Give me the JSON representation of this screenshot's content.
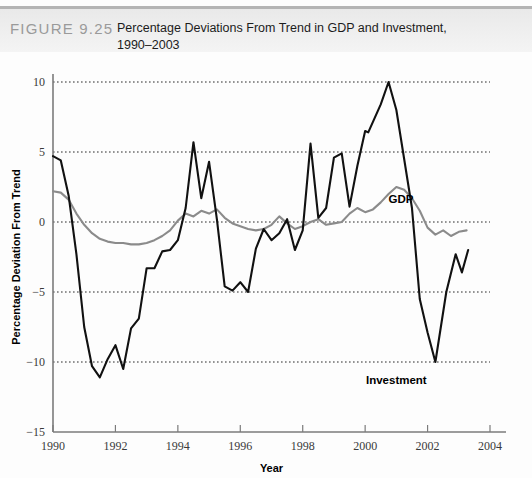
{
  "header": {
    "figure_label": "FIGURE 9.25",
    "caption_line1": "Percentage Deviations From Trend in GDP and Investment,",
    "caption_line2": "1990–2003"
  },
  "chart_data": {
    "type": "line",
    "title": "Percentage Deviations From Trend in GDP and Investment, 1990–2003",
    "xlabel": "Year",
    "ylabel": "Percentage Deviation From Trend",
    "xlim": [
      1990,
      2004
    ],
    "ylim": [
      -15,
      10
    ],
    "xticks": [
      1990,
      1992,
      1994,
      1996,
      1998,
      2000,
      2002,
      2004
    ],
    "xtick_labels": [
      "1990",
      "1992",
      "1994",
      "1996",
      "1998",
      "2000",
      "2002",
      "2004"
    ],
    "yticks": [
      10,
      5,
      0,
      -5,
      -10,
      -15
    ],
    "ytick_labels": [
      "10",
      "5",
      "0",
      "−5",
      "−10",
      "−15"
    ],
    "grid": "horizontal-dotted",
    "legend": "inline-annotations",
    "colors": {
      "gdp": "#8b8b8b",
      "investment": "#111111",
      "grid": "#2b2b2b",
      "axis": "#7b7b7b"
    },
    "annotations": [
      {
        "text": "GDP",
        "x": 2001.15,
        "y": 1.35
      },
      {
        "text": "Investment",
        "x": 2001.0,
        "y": -11.6
      }
    ],
    "series": [
      {
        "name": "GDP",
        "color": "#8b8b8b",
        "x": [
          1990.0,
          1990.25,
          1990.5,
          1990.75,
          1991.0,
          1991.25,
          1991.5,
          1991.75,
          1992.0,
          1992.25,
          1992.5,
          1992.75,
          1993.0,
          1993.25,
          1993.5,
          1993.75,
          1994.0,
          1994.25,
          1994.5,
          1994.75,
          1995.0,
          1995.25,
          1995.5,
          1995.75,
          1996.0,
          1996.25,
          1996.5,
          1996.75,
          1997.0,
          1997.25,
          1997.5,
          1997.75,
          1998.0,
          1998.25,
          1998.5,
          1998.75,
          1999.0,
          1999.25,
          1999.5,
          1999.75,
          2000.0,
          2000.25,
          2000.5,
          2000.75,
          2001.0,
          2001.25,
          2001.5,
          2001.75,
          2002.0,
          2002.25,
          2002.5,
          2002.75,
          2003.0,
          2003.25
        ],
        "values": [
          2.2,
          2.1,
          1.6,
          0.6,
          -0.2,
          -0.8,
          -1.2,
          -1.4,
          -1.5,
          -1.5,
          -1.6,
          -1.6,
          -1.5,
          -1.3,
          -1.0,
          -0.6,
          0.1,
          0.6,
          0.4,
          0.8,
          0.6,
          0.9,
          0.3,
          -0.1,
          -0.3,
          -0.5,
          -0.6,
          -0.5,
          -0.2,
          0.4,
          -0.1,
          -0.5,
          -0.3,
          0.0,
          0.2,
          -0.2,
          -0.1,
          0.0,
          0.6,
          1.0,
          0.7,
          0.9,
          1.4,
          2.0,
          2.5,
          2.3,
          1.7,
          0.8,
          -0.4,
          -0.9,
          -0.6,
          -1.0,
          -0.7,
          -0.6
        ]
      },
      {
        "name": "Investment",
        "color": "#111111",
        "x": [
          1990.0,
          1990.25,
          1990.5,
          1990.75,
          1991.0,
          1991.25,
          1991.5,
          1991.75,
          1992.0,
          1992.25,
          1992.5,
          1992.75,
          1993.0,
          1993.25,
          1993.5,
          1993.75,
          1994.0,
          1994.25,
          1994.5,
          1994.75,
          1995.0,
          1995.25,
          1995.5,
          1995.75,
          1996.0,
          1996.25,
          1996.5,
          1996.75,
          1997.0,
          1997.25,
          1997.5,
          1997.75,
          1998.0,
          1998.25,
          1998.5,
          1998.75,
          1999.0,
          1999.25,
          1999.5,
          1999.75,
          2000.0,
          2000.1,
          2000.5,
          2000.75,
          2001.0,
          2001.5,
          2001.75,
          2002.0,
          2002.25,
          2002.6,
          2002.9,
          2003.1,
          2003.3
        ],
        "values": [
          4.7,
          4.4,
          1.9,
          -2.3,
          -7.5,
          -10.3,
          -11.1,
          -9.8,
          -8.8,
          -10.5,
          -7.6,
          -6.9,
          -3.3,
          -3.3,
          -2.1,
          -2.0,
          -1.3,
          1.0,
          5.7,
          1.7,
          4.3,
          0.2,
          -4.6,
          -4.9,
          -4.3,
          -5.0,
          -1.9,
          -0.5,
          -1.3,
          -0.8,
          0.2,
          -2.0,
          -0.6,
          5.6,
          0.3,
          1.0,
          4.6,
          4.9,
          1.1,
          4.0,
          6.5,
          6.4,
          8.4,
          10.0,
          8.0,
          1.0,
          -5.5,
          -7.9,
          -10.0,
          -5.0,
          -2.3,
          -3.6,
          -2.0
        ]
      }
    ]
  }
}
